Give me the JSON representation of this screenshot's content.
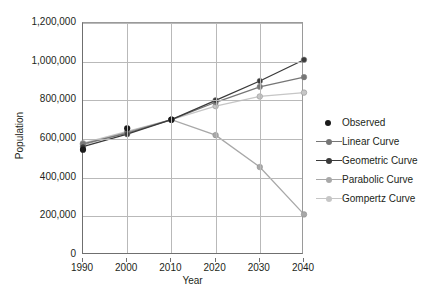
{
  "chart_data": {
    "type": "line",
    "title": "",
    "xlabel": "Year",
    "ylabel": "Population",
    "x": [
      1990,
      2000,
      2010,
      2020,
      2030,
      2040
    ],
    "xlim": [
      1990,
      2040
    ],
    "ylim": [
      0,
      1200000
    ],
    "grid": true,
    "legend_position": "right",
    "x_tick_labels": [
      "1990",
      "2000",
      "2010",
      "2020",
      "2030",
      "2040"
    ],
    "y_tick_labels": [
      "0",
      "200,000",
      "400,000",
      "600,000",
      "800,000",
      "1,000,000",
      "1,200,000"
    ],
    "y_tick_values": [
      0,
      200000,
      400000,
      600000,
      800000,
      1000000,
      1200000
    ],
    "series": [
      {
        "name": "Observed",
        "marker": "circle",
        "line": false,
        "color": "#1a1a1a",
        "x": [
          1990,
          2000,
          2010
        ],
        "values": [
          545000,
          655000,
          700000
        ]
      },
      {
        "name": "Linear Curve",
        "marker": "circle",
        "line": true,
        "color": "#767676",
        "x": [
          1990,
          2000,
          2010,
          2020,
          2030,
          2040
        ],
        "values": [
          575000,
          630000,
          700000,
          790000,
          870000,
          920000
        ]
      },
      {
        "name": "Geometric Curve",
        "marker": "circle",
        "line": true,
        "color": "#3a3a3a",
        "x": [
          1990,
          2000,
          2010,
          2020,
          2030,
          2040
        ],
        "values": [
          560000,
          625000,
          700000,
          800000,
          900000,
          1010000
        ]
      },
      {
        "name": "Parabolic Curve",
        "marker": "circle",
        "line": true,
        "color": "#a8a8a8",
        "x": [
          1990,
          2000,
          2010,
          2020,
          2030,
          2040
        ],
        "values": [
          570000,
          635000,
          700000,
          620000,
          455000,
          210000
        ]
      },
      {
        "name": "Gompertz Curve",
        "marker": "circle",
        "line": true,
        "color": "#c6c6c6",
        "x": [
          1990,
          2000,
          2010,
          2020,
          2030,
          2040
        ],
        "values": [
          578000,
          640000,
          700000,
          770000,
          820000,
          840000
        ]
      }
    ]
  },
  "caption": {
    "text": ""
  }
}
